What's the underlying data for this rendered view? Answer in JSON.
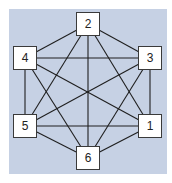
{
  "diagram": {
    "type": "complete-graph",
    "background_color": "#c6d1e4",
    "node_fill": "#ffffff",
    "node_border": "#3a3a3a",
    "edge_color": "#1f1f1f",
    "nodes": [
      {
        "id": "1",
        "label": "1",
        "x": 150,
        "y": 126
      },
      {
        "id": "2",
        "label": "2",
        "x": 88,
        "y": 24
      },
      {
        "id": "3",
        "label": "3",
        "x": 150,
        "y": 58
      },
      {
        "id": "4",
        "label": "4",
        "x": 25,
        "y": 58
      },
      {
        "id": "5",
        "label": "5",
        "x": 25,
        "y": 126
      },
      {
        "id": "6",
        "label": "6",
        "x": 88,
        "y": 158
      }
    ],
    "edges": [
      [
        "1",
        "2"
      ],
      [
        "1",
        "3"
      ],
      [
        "1",
        "4"
      ],
      [
        "1",
        "5"
      ],
      [
        "1",
        "6"
      ],
      [
        "2",
        "3"
      ],
      [
        "2",
        "4"
      ],
      [
        "2",
        "5"
      ],
      [
        "2",
        "6"
      ],
      [
        "3",
        "4"
      ],
      [
        "3",
        "5"
      ],
      [
        "3",
        "6"
      ],
      [
        "4",
        "5"
      ],
      [
        "4",
        "6"
      ],
      [
        "5",
        "6"
      ]
    ]
  }
}
